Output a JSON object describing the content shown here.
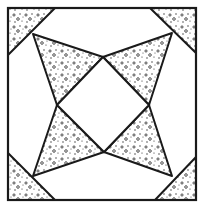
{
  "diagram": {
    "type": "quilt-block",
    "colors": {
      "background": "#ffffff",
      "line": "#1a1a1a",
      "speckle": "#2a2a2a"
    },
    "outer_square": {
      "x": 8,
      "y": 8,
      "w": 188,
      "h": 192
    },
    "center_diamond": [
      [
        103,
        57
      ],
      [
        149,
        105
      ],
      [
        104,
        152
      ],
      [
        57,
        105
      ]
    ],
    "shaded_shapes": [
      {
        "name": "corner-top-left",
        "points": [
          [
            8,
            8
          ],
          [
            55,
            8
          ],
          [
            8,
            55
          ]
        ]
      },
      {
        "name": "corner-top-right",
        "points": [
          [
            150,
            8
          ],
          [
            196,
            8
          ],
          [
            196,
            53
          ]
        ]
      },
      {
        "name": "corner-bottom-left",
        "points": [
          [
            8,
            153
          ],
          [
            55,
            200
          ],
          [
            8,
            200
          ]
        ]
      },
      {
        "name": "corner-bottom-right",
        "points": [
          [
            155,
            200
          ],
          [
            196,
            157
          ],
          [
            196,
            200
          ]
        ]
      },
      {
        "name": "kite-top-left",
        "points": [
          [
            33,
            34
          ],
          [
            103,
            57
          ],
          [
            57,
            105
          ]
        ]
      },
      {
        "name": "kite-top-right",
        "points": [
          [
            103,
            57
          ],
          [
            172,
            33
          ],
          [
            149,
            105
          ]
        ]
      },
      {
        "name": "kite-bottom-left",
        "points": [
          [
            57,
            105
          ],
          [
            104,
            152
          ],
          [
            33,
            176
          ]
        ]
      },
      {
        "name": "kite-bottom-right",
        "points": [
          [
            149,
            105
          ],
          [
            172,
            176
          ],
          [
            104,
            152
          ]
        ]
      }
    ]
  }
}
